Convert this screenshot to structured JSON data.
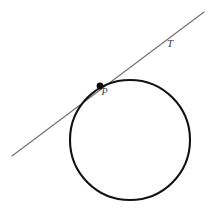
{
  "figure": {
    "background_color": "#ffffff",
    "width": 211,
    "height": 214,
    "labels": {
      "tangent_line": "T",
      "tangent_point": "P"
    },
    "colors": {
      "circle_stroke": "#121212",
      "line_stroke": "#6e6e6e",
      "point_fill": "#0d0d0d",
      "label_text": "#3a3a3a"
    }
  },
  "chart_data": {
    "type": "diagram",
    "xlabel": "",
    "ylabel": "",
    "grid": false,
    "legend": "none",
    "xlim": [
      0,
      211
    ],
    "ylim": [
      0,
      214
    ],
    "shapes": [
      {
        "kind": "circle",
        "name": "circle",
        "center": [
          130,
          140
        ],
        "radius": 60,
        "stroke": "#121212",
        "stroke_width": 2.1,
        "fill": "none"
      },
      {
        "kind": "line",
        "name": "tangent-line",
        "label": "T",
        "from": [
          12,
          156
        ],
        "to": [
          204,
          12
        ],
        "stroke": "#6e6e6e",
        "stroke_width": 1.1
      },
      {
        "kind": "point",
        "name": "tangent-point",
        "label": "P",
        "at": [
          100,
          86
        ],
        "radius": 3.4,
        "fill": "#0d0d0d"
      }
    ],
    "annotations": [
      {
        "text": "T",
        "at": [
          172,
          47
        ],
        "style": "italic-serif",
        "font_size": 11
      },
      {
        "text": "P",
        "at": [
          106,
          95
        ],
        "style": "italic-serif",
        "font_size": 10
      }
    ]
  }
}
